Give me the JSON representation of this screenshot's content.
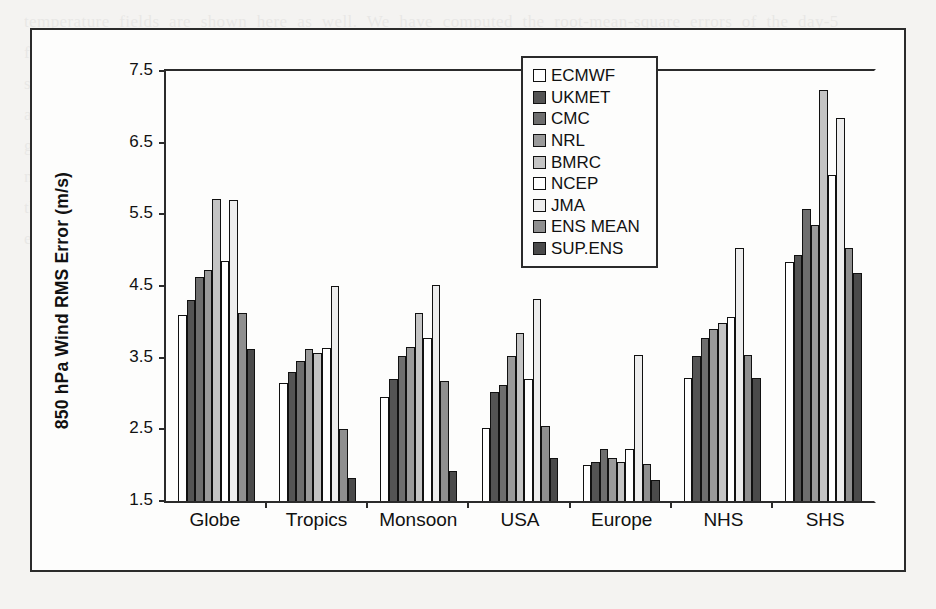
{
  "figure": {
    "y_axis_title": "850 hPa Wind RMS Error (m/s)"
  },
  "legend": {
    "position": "top-center-right",
    "items": [
      {
        "label": "ECMWF",
        "color": "#ffffff"
      },
      {
        "label": "UKMET",
        "color": "#545454"
      },
      {
        "label": "CMC",
        "color": "#6e6e6e"
      },
      {
        "label": "NRL",
        "color": "#9a9a9a"
      },
      {
        "label": "BMRC",
        "color": "#c4c4c4"
      },
      {
        "label": "NCEP",
        "color": "#ffffff"
      },
      {
        "label": "JMA",
        "color": "#ededed"
      },
      {
        "label": "ENS MEAN",
        "color": "#8f8f8f"
      },
      {
        "label": "SUP.ENS",
        "color": "#4a4a4a"
      }
    ]
  },
  "axis": {
    "y_ticks": [
      "7.5",
      "6.5",
      "5.5",
      "4.5",
      "3.5",
      "2.5",
      "1.5"
    ]
  },
  "chart_data": {
    "type": "bar",
    "title": "",
    "xlabel": "",
    "ylabel": "850 hPa Wind RMS Error (m/s)",
    "ylim": [
      1.5,
      7.5
    ],
    "ytick_values": [
      1.5,
      2.5,
      3.5,
      4.5,
      5.5,
      6.5,
      7.5
    ],
    "grid": false,
    "legend_position": "upper center",
    "categories": [
      "Globe",
      "Tropics",
      "Monsoon",
      "USA",
      "Europe",
      "NHS",
      "SHS"
    ],
    "series": [
      {
        "name": "ECMWF",
        "color": "#ffffff",
        "values": [
          4.1,
          3.15,
          2.95,
          2.52,
          2.0,
          3.22,
          4.83
        ]
      },
      {
        "name": "UKMET",
        "color": "#545454",
        "values": [
          4.3,
          3.3,
          3.2,
          3.02,
          2.05,
          3.52,
          4.93
        ]
      },
      {
        "name": "CMC",
        "color": "#6e6e6e",
        "values": [
          4.62,
          3.46,
          3.52,
          3.12,
          2.22,
          3.78,
          5.58
        ]
      },
      {
        "name": "NRL",
        "color": "#9a9a9a",
        "values": [
          4.73,
          3.62,
          3.65,
          3.52,
          2.1,
          3.9,
          5.35
        ]
      },
      {
        "name": "BMRC",
        "color": "#c4c4c4",
        "values": [
          5.72,
          3.56,
          4.12,
          3.85,
          2.05,
          3.98,
          7.24
        ]
      },
      {
        "name": "NCEP",
        "color": "#ffffff",
        "values": [
          4.85,
          3.63,
          3.78,
          3.2,
          2.22,
          4.07,
          6.05
        ]
      },
      {
        "name": "JMA",
        "color": "#ededed",
        "values": [
          5.7,
          4.5,
          4.52,
          4.32,
          3.54,
          5.03,
          6.85
        ]
      },
      {
        "name": "ENS MEAN",
        "color": "#8f8f8f",
        "values": [
          4.12,
          2.5,
          3.18,
          2.55,
          2.02,
          3.54,
          5.03
        ]
      },
      {
        "name": "SUP.ENS",
        "color": "#4a4a4a",
        "values": [
          3.62,
          1.82,
          1.92,
          2.1,
          1.8,
          3.22,
          4.68
        ]
      }
    ]
  },
  "ghost_text": "temperature fields are shown here as well. We have computed the root-mean-square errors of the day-5 forecasts of the various models, as well as the ensemble mean and the superensemble. The multimodel superensemble is shown to have the lowest RMS errors compared to the member models, the ensemble mean and the individual model forecasts. The skill of these forecasts is somewhat uniform across the different geographical regions examined. The 850 hPa wind RMS errors are displayed for the globe, the tropics, the monsoon domain, the USA, Europe, the northern hemisphere and the southern hemisphere respectively, where the superensemble consistently shows the lowest error values among all of the forecast products that were examined in this study."
}
